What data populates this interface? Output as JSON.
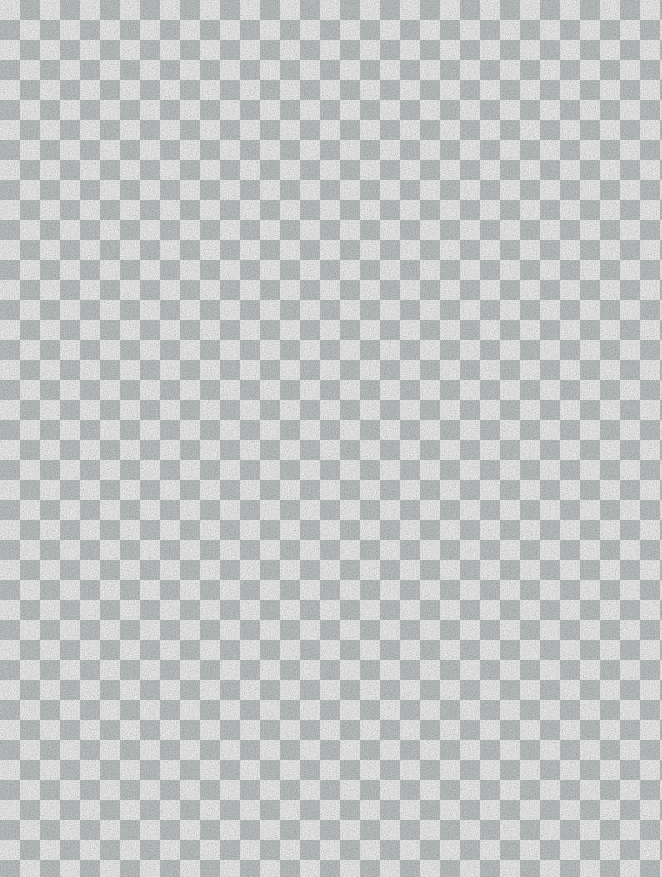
{
  "canvas": {
    "width": 662,
    "height": 877,
    "description": "Transparency checkerboard pattern filling the entire frame. No user interface chrome, text, icons or controls are rendered."
  },
  "checkerboard": {
    "cell_size": 20,
    "origin_cell_color": "#ccd0d0",
    "alternate_cell_color": "#fdfdfd",
    "origin_cell_position": "top-left",
    "columns": 34,
    "rows": 44,
    "texture": "subtle paper grain noise overlay"
  },
  "artifacts": [
    {
      "name": "scan-speck",
      "x": 489,
      "y": 486,
      "size": 3
    },
    {
      "name": "scan-speck",
      "x": 22,
      "y": 545,
      "size": 2
    },
    {
      "name": "scan-speck",
      "x": 176,
      "y": 523,
      "size": 2
    },
    {
      "name": "scan-speck",
      "x": 241,
      "y": 582,
      "size": 2
    }
  ]
}
